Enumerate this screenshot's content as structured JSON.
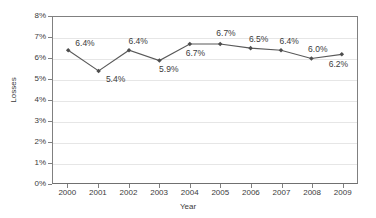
{
  "chart_data": {
    "type": "line",
    "title": "",
    "xlabel": "Year",
    "ylabel": "Losses",
    "categories": [
      "2000",
      "2001",
      "2002",
      "2003",
      "2004",
      "2005",
      "2006",
      "2007",
      "2008",
      "2009"
    ],
    "x": [
      2000,
      2001,
      2002,
      2003,
      2004,
      2005,
      2006,
      2007,
      2008,
      2009
    ],
    "values": [
      6.4,
      5.4,
      6.4,
      5.9,
      6.7,
      6.7,
      6.5,
      6.4,
      6.0,
      6.2
    ],
    "point_labels": [
      "6.4%",
      "5.4%",
      "6.4%",
      "5.9%",
      "6.7%",
      "6.7%",
      "6.5%",
      "6.4%",
      "6.0%",
      "6.2%"
    ],
    "ylim": [
      0,
      8
    ],
    "ytick_values": [
      0,
      1,
      2,
      3,
      4,
      5,
      6,
      7,
      8
    ],
    "ytick_labels": [
      "0%",
      "1%",
      "2%",
      "3%",
      "4%",
      "5%",
      "6%",
      "7%",
      "8%"
    ],
    "grid": true,
    "grid_axis": "y",
    "legend": false,
    "series_color": "#595959",
    "marker": "diamond",
    "marker_color": "#4d4d4d",
    "gridline_color": "#e6e6e6",
    "axis_color": "#808080",
    "background": "#ffffff",
    "text_color": "#3b3b3b",
    "label_offsets": [
      {
        "dx": 8,
        "dy": -11
      },
      {
        "dx": 8,
        "dy": 4
      },
      {
        "dx": 0,
        "dy": -13
      },
      {
        "dx": 0,
        "dy": 5
      },
      {
        "dx": -4,
        "dy": 6
      },
      {
        "dx": -4,
        "dy": -14
      },
      {
        "dx": -2,
        "dy": -13
      },
      {
        "dx": -2,
        "dy": -13
      },
      {
        "dx": -4,
        "dy": -13
      },
      {
        "dx": -14,
        "dy": 6
      }
    ]
  }
}
